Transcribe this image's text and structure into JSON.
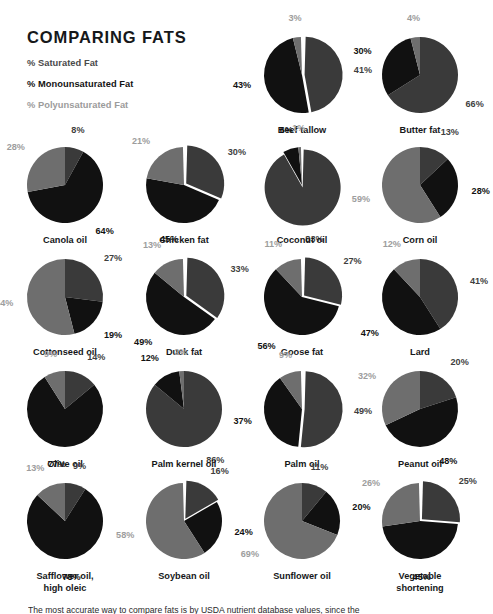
{
  "header": {
    "title": "COMPARING FATS",
    "legend": [
      {
        "label": "% Saturated Fat",
        "color": "#4a4a4a",
        "key": "saturated"
      },
      {
        "label": "% Monounsaturated Fat",
        "color": "#141414",
        "key": "monounsaturated"
      },
      {
        "label": "% Polyunsaturated Fat",
        "color": "#9b9b9b",
        "key": "polyunsaturated"
      }
    ]
  },
  "colors": {
    "saturated": "#3a3a3a",
    "monounsaturated": "#111111",
    "polyunsaturated": "#6e6e6e",
    "background": "#ffffff",
    "text": "#16181a"
  },
  "footer": {
    "note": "The most accurate way to compare fats is by USDA nutrient database values, since the"
  },
  "chart_data": {
    "type": "pie",
    "title": "COMPARING FATS",
    "series_names": [
      "% Saturated Fat",
      "% Monounsaturated Fat",
      "% Polyunsaturated Fat"
    ],
    "units": "percent",
    "legend": "top-left",
    "charts": [
      {
        "name": "Beef tallow",
        "saturated": 41,
        "monounsaturated": 43,
        "polyunsaturated": 3,
        "exploded": true
      },
      {
        "name": "Butter fat",
        "saturated": 66,
        "monounsaturated": 30,
        "polyunsaturated": 4,
        "exploded": false
      },
      {
        "name": "Canola oil",
        "saturated": 8,
        "monounsaturated": 64,
        "polyunsaturated": 28,
        "exploded": false
      },
      {
        "name": "Chicken fat",
        "saturated": 30,
        "monounsaturated": 45,
        "polyunsaturated": 21,
        "exploded": true
      },
      {
        "name": "Coconut oil",
        "saturated": 83,
        "monounsaturated": 6,
        "polyunsaturated": 1,
        "exploded": true
      },
      {
        "name": "Corn oil",
        "saturated": 13,
        "monounsaturated": 28,
        "polyunsaturated": 59,
        "exploded": false
      },
      {
        "name": "Cottonseed oil",
        "saturated": 27,
        "monounsaturated": 19,
        "polyunsaturated": 54,
        "exploded": false
      },
      {
        "name": "Duck fat",
        "saturated": 33,
        "monounsaturated": 49,
        "polyunsaturated": 13,
        "exploded": true
      },
      {
        "name": "Goose fat",
        "saturated": 27,
        "monounsaturated": 56,
        "polyunsaturated": 11,
        "exploded": true
      },
      {
        "name": "Lard",
        "saturated": 41,
        "monounsaturated": 47,
        "polyunsaturated": 12,
        "exploded": false
      },
      {
        "name": "Olive oil",
        "saturated": 14,
        "monounsaturated": 77,
        "polyunsaturated": 9,
        "exploded": false
      },
      {
        "name": "Palm kernel oil",
        "saturated": 86,
        "monounsaturated": 12,
        "polyunsaturated": 2,
        "exploded": false
      },
      {
        "name": "Palm oil",
        "saturated": 49,
        "monounsaturated": 37,
        "polyunsaturated": 9,
        "exploded": true
      },
      {
        "name": "Peanut oil",
        "saturated": 20,
        "monounsaturated": 48,
        "polyunsaturated": 32,
        "exploded": false
      },
      {
        "name": "Safflower oil, high oleic",
        "name_lines": [
          "Safflower oil,",
          "high oleic"
        ],
        "saturated": 9,
        "monounsaturated": 78,
        "polyunsaturated": 13,
        "exploded": false
      },
      {
        "name": "Soybean oil",
        "saturated": 16,
        "monounsaturated": 24,
        "polyunsaturated": 58,
        "exploded": true
      },
      {
        "name": "Sunflower oil",
        "saturated": 11,
        "monounsaturated": 20,
        "polyunsaturated": 69,
        "exploded": false
      },
      {
        "name": "Vegetable shortening",
        "name_lines": [
          "Vegetable",
          "shortening"
        ],
        "saturated": 25,
        "monounsaturated": 45,
        "polyunsaturated": 26,
        "exploded": true
      }
    ]
  },
  "layout": {
    "columns": 4,
    "cells": [
      {
        "chart": 0,
        "cx": 302,
        "cy": 75,
        "r": 38
      },
      {
        "chart": 1,
        "cx": 420,
        "cy": 75,
        "r": 38
      },
      {
        "chart": 2,
        "cx": 65,
        "cy": 185,
        "r": 38
      },
      {
        "chart": 3,
        "cx": 184,
        "cy": 185,
        "r": 38
      },
      {
        "chart": 4,
        "cx": 302,
        "cy": 185,
        "r": 38
      },
      {
        "chart": 5,
        "cx": 420,
        "cy": 185,
        "r": 38
      },
      {
        "chart": 6,
        "cx": 65,
        "cy": 297,
        "r": 38
      },
      {
        "chart": 7,
        "cx": 184,
        "cy": 297,
        "r": 38
      },
      {
        "chart": 8,
        "cx": 302,
        "cy": 297,
        "r": 38
      },
      {
        "chart": 9,
        "cx": 420,
        "cy": 297,
        "r": 38
      },
      {
        "chart": 10,
        "cx": 65,
        "cy": 409,
        "r": 38
      },
      {
        "chart": 11,
        "cx": 184,
        "cy": 409,
        "r": 38
      },
      {
        "chart": 12,
        "cx": 302,
        "cy": 409,
        "r": 38
      },
      {
        "chart": 13,
        "cx": 420,
        "cy": 409,
        "r": 38
      },
      {
        "chart": 14,
        "cx": 65,
        "cy": 521,
        "r": 38
      },
      {
        "chart": 15,
        "cx": 184,
        "cy": 521,
        "r": 38
      },
      {
        "chart": 16,
        "cx": 302,
        "cy": 521,
        "r": 38
      },
      {
        "chart": 17,
        "cx": 420,
        "cy": 521,
        "r": 38
      }
    ]
  }
}
